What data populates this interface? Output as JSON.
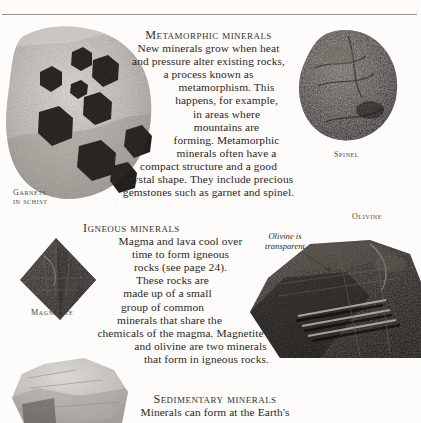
{
  "page": {
    "background": "#fdfcfb",
    "text_color": "#2b2723",
    "rule_color": "#9a948e"
  },
  "sections": [
    {
      "id": "metamorphic",
      "heading": "Metamorphic minerals",
      "lines": [
        "New minerals grow when heat",
        "and pressure alter existing rocks,",
        "a process known as",
        "metamorphism. This",
        "happens, for example,",
        "in areas where",
        "mountains are",
        "forming. Metamorphic",
        "minerals often have a",
        "compact structure and a good",
        "crystal shape. They include precious",
        "gemstones such as garnet and spinel."
      ]
    },
    {
      "id": "igneous",
      "heading": "Igneous minerals",
      "lines": [
        "Magma and lava cool over",
        "time to form igneous",
        "rocks (see page 24).",
        "These rocks are",
        "made up of a small",
        "group of common",
        "minerals that share the",
        "chemicals of the magma. Magnetite",
        "and olivine are two minerals",
        "that form in igneous rocks."
      ]
    },
    {
      "id": "sedimentary",
      "heading": "Sedimentary minerals",
      "lines": [
        "Minerals can form at the Earth's"
      ]
    }
  ],
  "specimens": [
    {
      "id": "garnets-in-schist",
      "caption_lines": [
        "Garnets",
        "in schist"
      ],
      "rock_color": "#b9b5ae",
      "crystal_color": "#231f1d"
    },
    {
      "id": "spinel",
      "caption_lines": [
        "Spinel"
      ],
      "rock_color": "#3a342f"
    },
    {
      "id": "magnetite",
      "caption_lines": [
        "Magnetite"
      ],
      "rock_color": "#2c2926"
    },
    {
      "id": "olivine",
      "caption_lines": [
        "Olivine"
      ],
      "rock_color": "#322e2a",
      "annotation": "Olivine is\ntransparent",
      "annotation_line_1": "Olivine is",
      "annotation_line_2": "transparent"
    },
    {
      "id": "sedimentary-rock",
      "caption_lines": [],
      "rock_color": "#cbc8c3"
    }
  ]
}
